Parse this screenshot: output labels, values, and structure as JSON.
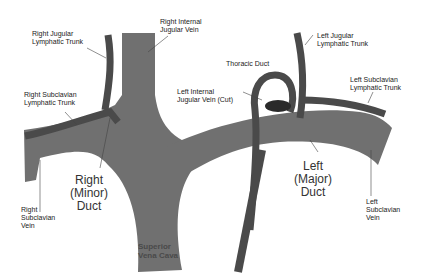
{
  "diagram": {
    "colors": {
      "vein": "#707070",
      "lymph": "#4a4a4a",
      "duct_opening": "#2a2a2a",
      "background": "#ffffff"
    },
    "labels": {
      "right_jugular_trunk": "Right Jugular\nLymphatic Trunk",
      "right_internal_jugular": "Right Internal\nJugular Vein",
      "right_subclavian_trunk": "Right Subclavian\nLymphatic Trunk",
      "right_subclavian_vein": "Right\nSubclavian\nVein",
      "right_duct": "Right\n(Minor)\nDuct",
      "svc": "Superior\nVena Cava",
      "left_jugular_trunk": "Left Jugular\nLymphatic Trunk",
      "thoracic_duct": "Thoracic Duct",
      "left_internal_jugular": "Left Internal\nJugular Vein (Cut)",
      "left_subclavian_trunk": "Left Subclavian\nLymphatic Trunk",
      "left_duct": "Left\n(Major)\nDuct",
      "left_subclavian_vein": "Left\nSubclavian\nVein"
    }
  }
}
